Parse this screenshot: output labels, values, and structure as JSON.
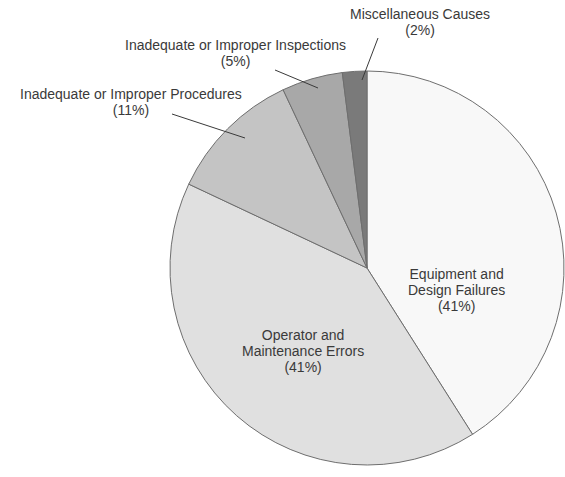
{
  "chart_data": {
    "type": "pie",
    "title": "",
    "categories": [
      "Equipment and Design Failures",
      "Operator and Maintenance Errors",
      "Inadequate or Improper Procedures",
      "Inadequate or Improper Inspections",
      "Miscellaneous Causes"
    ],
    "values": [
      41,
      41,
      11,
      5,
      2
    ],
    "colors": [
      "#f8f8f8",
      "#e0e0e0",
      "#c4c4c4",
      "#a8a8a8",
      "#7a7a7a"
    ],
    "start_angle": "12 o'clock, clockwise",
    "legend": "none (callout labels)"
  },
  "labels": {
    "equipment": {
      "line1": "Equipment and",
      "line2": "Design Failures",
      "pct": "(41%)"
    },
    "operator": {
      "line1": "Operator and",
      "line2": "Maintenance Errors",
      "pct": "(41%)"
    },
    "procedures": {
      "line1": "Inadequate or Improper Procedures",
      "pct": "(11%)"
    },
    "inspections": {
      "line1": "Inadequate or Improper Inspections",
      "pct": "(5%)"
    },
    "misc": {
      "line1": "Miscellaneous Causes",
      "pct": "(2%)"
    }
  }
}
